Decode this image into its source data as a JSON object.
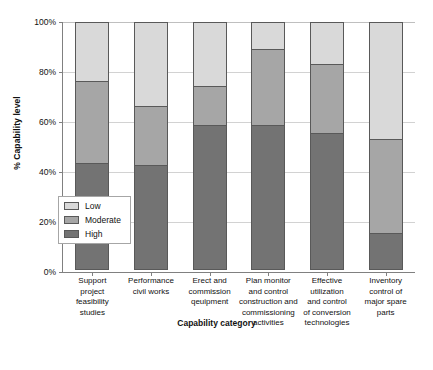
{
  "chart_data": {
    "type": "bar",
    "subtype": "stacked-bar-100-percent",
    "title": "",
    "xlabel": "Capability category",
    "ylabel": "% Capability level",
    "ylim": [
      0,
      100
    ],
    "ytick_labels": [
      "0%",
      "20%",
      "40%",
      "60%",
      "80%",
      "100%"
    ],
    "ytick_values": [
      0,
      20,
      40,
      60,
      80,
      100
    ],
    "grid": true,
    "legend_position": "inner-lower-left",
    "categories": [
      "Support project feasibility studies",
      "Performance civil works",
      "Erect and commission qeuipment",
      "Plan monitor and control construction and commissioning activities",
      "Effective utilization and control of conversion technologies",
      "Inventory control of major spare parts"
    ],
    "category_label_lines": [
      [
        "Support",
        "project",
        "feasibility",
        "studies"
      ],
      [
        "Performance",
        "civil works"
      ],
      [
        "Erect and",
        "commission",
        "qeuipment"
      ],
      [
        "Plan monitor",
        "and control",
        "construction and",
        "commissioning",
        "activities"
      ],
      [
        "Effective",
        "utilization",
        "and control",
        "of conversion",
        "technologies"
      ],
      [
        "Inventory",
        "control of",
        "major spare",
        "parts"
      ]
    ],
    "series": [
      {
        "name": "Low",
        "color": "#d9d9d9",
        "values": [
          24,
          34,
          26,
          11,
          17,
          47
        ]
      },
      {
        "name": "Moderate",
        "color": "#a6a6a6",
        "values": [
          33,
          24,
          16,
          31,
          28,
          38
        ]
      },
      {
        "name": "High",
        "color": "#737373",
        "values": [
          43,
          42,
          58,
          58,
          55,
          15
        ]
      }
    ],
    "stack_order_top_to_bottom": [
      "Low",
      "Moderate",
      "High"
    ],
    "segment_boundaries_percent": [
      {
        "category_index": 0,
        "high_top": 43,
        "moderate_top": 76
      },
      {
        "category_index": 1,
        "high_top": 42,
        "moderate_top": 66
      },
      {
        "category_index": 2,
        "high_top": 58,
        "moderate_top": 74
      },
      {
        "category_index": 3,
        "high_top": 58,
        "moderate_top": 89
      },
      {
        "category_index": 4,
        "high_top": 55,
        "moderate_top": 83
      },
      {
        "category_index": 5,
        "high_top": 15,
        "moderate_top": 53
      }
    ]
  },
  "legend": {
    "items": [
      {
        "label": "Low",
        "color": "#d9d9d9"
      },
      {
        "label": "Moderate",
        "color": "#a6a6a6"
      },
      {
        "label": "High",
        "color": "#737373"
      }
    ]
  },
  "axes": {
    "x_title": "Capability category",
    "y_title": "% Capability level"
  }
}
